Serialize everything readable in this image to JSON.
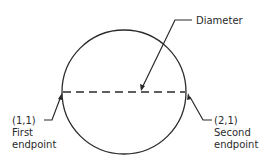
{
  "diagram": {
    "labels": {
      "diameter": "Diameter",
      "first_coord": "(1,1)",
      "first_line1": "First",
      "first_line2": "endpoint",
      "second_coord": "(2,1)",
      "second_line1": "Second",
      "second_line2": "endpoint"
    },
    "colors": {
      "stroke": "#2a2a2a",
      "background": "#ffffff"
    }
  }
}
